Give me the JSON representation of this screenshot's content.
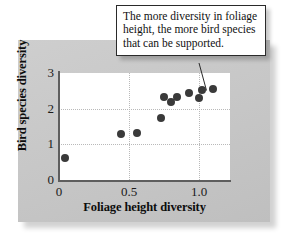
{
  "figure": {
    "callout": {
      "text": "The more diversity in foliage height, the more bird species that can be supported."
    }
  },
  "chart_data": {
    "type": "scatter",
    "title": "",
    "xlabel": "Foliage height diversity",
    "ylabel": "Bird species diversity",
    "xlim": [
      0,
      1.22
    ],
    "ylim": [
      0,
      3
    ],
    "xticks": [
      "0",
      "0.5",
      "1.0"
    ],
    "xtick_values": [
      0,
      0.5,
      1.0
    ],
    "yticks": [
      "0",
      "1",
      "2",
      "3"
    ],
    "ytick_values": [
      0,
      1,
      2,
      3
    ],
    "grid": true,
    "gridlines": {
      "horizontal": [
        1,
        2
      ],
      "vertical": [
        0.5,
        1.0
      ]
    },
    "legend": null,
    "marker_color": "#3a3a3a",
    "points": [
      {
        "x": 0.04,
        "y": 0.62
      },
      {
        "x": 0.44,
        "y": 1.28
      },
      {
        "x": 0.56,
        "y": 1.33
      },
      {
        "x": 0.73,
        "y": 1.75
      },
      {
        "x": 0.75,
        "y": 2.32
      },
      {
        "x": 0.8,
        "y": 2.19
      },
      {
        "x": 0.84,
        "y": 2.33
      },
      {
        "x": 0.93,
        "y": 2.44
      },
      {
        "x": 1.0,
        "y": 2.3
      },
      {
        "x": 1.02,
        "y": 2.52
      },
      {
        "x": 1.1,
        "y": 2.55
      }
    ],
    "annotation": {
      "text": "The more diversity in foliage height, the more bird species that can be supported.",
      "points_to": {
        "x": 1.02,
        "y": 2.52
      }
    }
  }
}
